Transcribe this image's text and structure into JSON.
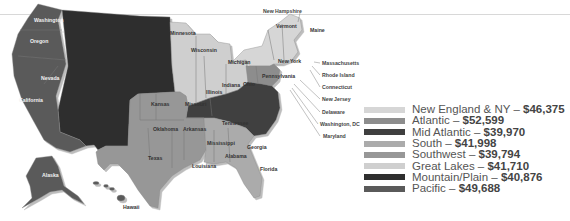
{
  "map": {
    "regions": {
      "new_england_ny": {
        "color": "#d6d6d6"
      },
      "atlantic": {
        "color": "#8d8d8d"
      },
      "mid_atlantic": {
        "color": "#3f3f3f"
      },
      "south": {
        "color": "#ababab"
      },
      "southwest": {
        "color": "#979797"
      },
      "great_lakes": {
        "color": "#cfcfcf"
      },
      "mountain_plain": {
        "color": "#2f2f2f"
      },
      "pacific": {
        "color": "#5a5a5a"
      }
    },
    "state_labels": {
      "washington": "Washington",
      "oregon": "Oregon",
      "nevada": "Nevada",
      "california": "California",
      "alaska": "Alaska",
      "hawaii": "Hawaii",
      "minnesota": "Minnesota",
      "wisconsin": "Wisconsin",
      "michigan": "Michigan",
      "illinois": "Illinois",
      "indiana": "Indiana",
      "ohio": "Ohio",
      "kansas": "Kansas",
      "missouri": "Missouri",
      "oklahoma": "Oklahoma",
      "arkansas": "Arkansas",
      "texas": "Texas",
      "louisiana": "Louisiana",
      "mississippi": "Mississippi",
      "alabama": "Alabama",
      "georgia": "Georgia",
      "tennessee": "Tennessee",
      "florida": "Florida",
      "pennsylvania": "Pennsylvania",
      "new_york": "New York",
      "vermont": "Vermont",
      "maine": "Maine"
    },
    "callouts": {
      "new_hampshire": "New Hampshire",
      "massachusetts": "Massachusetts",
      "rhode_island": "Rhode Island",
      "connecticut": "Connecticut",
      "new_jersey": "New Jersey",
      "delaware": "Delaware",
      "washington_dc": "Washington, DC",
      "maryland": "Maryland"
    }
  },
  "legend": {
    "items": [
      {
        "region": "New England & NY",
        "value": "$46,375",
        "color": "#d6d6d6"
      },
      {
        "region": "Atlantic",
        "value": "$52,599",
        "color": "#8d8d8d"
      },
      {
        "region": "Mid Atlantic",
        "value": "$39,970",
        "color": "#3f3f3f"
      },
      {
        "region": "South",
        "value": "$41,998",
        "color": "#ababab"
      },
      {
        "region": "Southwest",
        "value": "$39,794",
        "color": "#979797"
      },
      {
        "region": "Great Lakes",
        "value": "$41,710",
        "color": "#cfcfcf"
      },
      {
        "region": "Mountain/Plain",
        "value": "$40,876",
        "color": "#2f2f2f"
      },
      {
        "region": "Pacific",
        "value": "$49,688",
        "color": "#5a5a5a"
      }
    ],
    "separator": " – "
  }
}
